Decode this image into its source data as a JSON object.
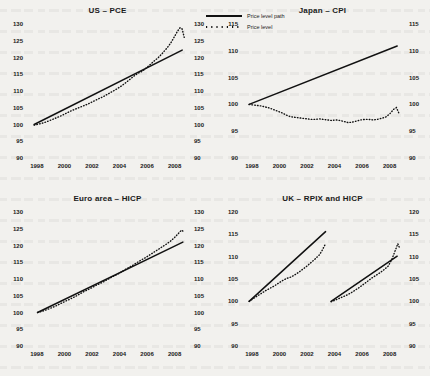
{
  "legend": {
    "items": [
      {
        "name": "price-level-path",
        "label": "Price level path",
        "style": "solid"
      },
      {
        "name": "price-level",
        "label": "Price level",
        "style": "dotted"
      }
    ]
  },
  "colors": {
    "ink": "#111111",
    "paper": "#f2f1ee"
  },
  "chart_data": [
    {
      "type": "line",
      "title": "US – PCE",
      "xlabel": "",
      "ylabel": "",
      "xlim": [
        1997.5,
        2008.9
      ],
      "ylim": [
        90,
        130
      ],
      "yticks": [
        90,
        95,
        100,
        105,
        110,
        115,
        120,
        125,
        130
      ],
      "xticks": [
        1998,
        2000,
        2002,
        2004,
        2006,
        2008
      ],
      "grid": false,
      "dual_axis": true,
      "series": [
        {
          "name": "Price level path",
          "style": "solid",
          "x": [
            1997.8,
            2008.55
          ],
          "values": [
            100.0,
            122.2
          ]
        },
        {
          "name": "Price level",
          "style": "dotted",
          "x": [
            1997.8,
            1998.1,
            1998.4,
            1998.7,
            1999.0,
            1999.3,
            1999.6,
            1999.9,
            2000.2,
            2000.5,
            2000.8,
            2001.1,
            2001.4,
            2001.7,
            2002.0,
            2002.3,
            2002.6,
            2002.9,
            2003.2,
            2003.5,
            2003.8,
            2004.1,
            2004.4,
            2004.7,
            2005.0,
            2005.3,
            2005.6,
            2005.9,
            2006.2,
            2006.5,
            2006.8,
            2007.1,
            2007.4,
            2007.7,
            2008.0,
            2008.2,
            2008.4,
            2008.55,
            2008.7
          ],
          "values": [
            99.8,
            100.1,
            100.4,
            100.8,
            101.3,
            101.8,
            102.3,
            102.9,
            103.5,
            104.1,
            104.6,
            105.1,
            105.6,
            106.1,
            106.7,
            107.3,
            107.9,
            108.5,
            109.2,
            109.9,
            110.6,
            111.4,
            112.3,
            113.3,
            114.3,
            115.2,
            115.8,
            116.7,
            117.8,
            118.9,
            119.9,
            121.2,
            122.6,
            124.2,
            126.3,
            127.8,
            128.9,
            128.5,
            126.0
          ]
        }
      ]
    },
    {
      "type": "line",
      "title": "Japan – CPI",
      "xlabel": "",
      "ylabel": "",
      "xlim": [
        1997.5,
        2008.9
      ],
      "ylim": [
        90,
        115
      ],
      "yticks": [
        90,
        95,
        100,
        105,
        110,
        115
      ],
      "xticks": [
        1998,
        2000,
        2002,
        2004,
        2006,
        2008
      ],
      "grid": false,
      "dual_axis": true,
      "series": [
        {
          "name": "Price level path",
          "style": "solid",
          "x": [
            1997.8,
            2008.55
          ],
          "values": [
            100.0,
            110.9
          ]
        },
        {
          "name": "Price level",
          "style": "dotted",
          "x": [
            1997.8,
            1998.1,
            1998.4,
            1998.7,
            1999.0,
            1999.3,
            1999.6,
            1999.9,
            2000.2,
            2000.5,
            2000.8,
            2001.1,
            2001.4,
            2001.7,
            2002.0,
            2002.3,
            2002.6,
            2002.9,
            2003.2,
            2003.5,
            2003.8,
            2004.1,
            2004.4,
            2004.7,
            2005.0,
            2005.3,
            2005.6,
            2005.9,
            2006.2,
            2006.5,
            2006.8,
            2007.1,
            2007.4,
            2007.7,
            2008.0,
            2008.3,
            2008.5,
            2008.7
          ],
          "values": [
            100.0,
            99.9,
            99.8,
            99.7,
            99.5,
            99.3,
            99.0,
            98.7,
            98.4,
            98.0,
            97.7,
            97.6,
            97.5,
            97.4,
            97.3,
            97.2,
            97.2,
            97.3,
            97.2,
            97.1,
            97.0,
            97.1,
            97.0,
            96.8,
            96.6,
            96.7,
            96.9,
            97.1,
            97.2,
            97.2,
            97.1,
            97.2,
            97.4,
            97.6,
            98.2,
            99.1,
            99.4,
            98.2
          ]
        }
      ]
    },
    {
      "type": "line",
      "title": "Euro area – HICP",
      "xlabel": "",
      "ylabel": "",
      "xlim": [
        1997.5,
        2008.9
      ],
      "ylim": [
        90,
        130
      ],
      "yticks": [
        90,
        95,
        100,
        105,
        110,
        115,
        120,
        125,
        130
      ],
      "xticks": [
        1998,
        2000,
        2002,
        2004,
        2006,
        2008
      ],
      "grid": false,
      "dual_axis": true,
      "series": [
        {
          "name": "Price level path",
          "style": "solid",
          "x": [
            1998.05,
            2008.6
          ],
          "values": [
            100.0,
            121.0
          ]
        },
        {
          "name": "Price level",
          "style": "dotted",
          "x": [
            1998.05,
            1998.4,
            1998.7,
            1999.0,
            1999.3,
            1999.6,
            1999.9,
            2000.2,
            2000.5,
            2000.8,
            2001.1,
            2001.4,
            2001.7,
            2002.0,
            2002.3,
            2002.6,
            2002.9,
            2003.2,
            2003.5,
            2003.8,
            2004.1,
            2004.4,
            2004.7,
            2005.0,
            2005.3,
            2005.6,
            2005.9,
            2006.2,
            2006.5,
            2006.8,
            2007.1,
            2007.4,
            2007.7,
            2008.0,
            2008.3,
            2008.5,
            2008.7
          ],
          "values": [
            100.0,
            100.4,
            100.8,
            101.3,
            101.8,
            102.4,
            103.0,
            103.6,
            104.2,
            104.8,
            105.5,
            106.2,
            106.8,
            107.4,
            108.1,
            108.7,
            109.3,
            110.0,
            110.7,
            111.3,
            112.0,
            112.8,
            113.5,
            114.2,
            115.0,
            115.7,
            116.4,
            117.2,
            118.0,
            118.8,
            119.6,
            120.4,
            121.3,
            122.4,
            123.7,
            124.6,
            124.0
          ]
        }
      ]
    },
    {
      "type": "line",
      "title": "UK – RPIX and HICP",
      "xlabel": "",
      "ylabel": "",
      "xlim": [
        1997.5,
        2008.9
      ],
      "ylim": [
        90,
        120
      ],
      "yticks": [
        90,
        95,
        100,
        105,
        110,
        115,
        120
      ],
      "xticks": [
        1998,
        2000,
        2002,
        2004,
        2006,
        2008
      ],
      "grid": false,
      "dual_axis": true,
      "series": [
        {
          "name": "Price level path",
          "style": "solid",
          "segment": "RPIX",
          "x": [
            1997.8,
            2003.35
          ],
          "values": [
            100.0,
            115.6
          ]
        },
        {
          "name": "Price level",
          "style": "dotted",
          "segment": "RPIX",
          "x": [
            1997.8,
            1998.1,
            1998.4,
            1998.7,
            1999.0,
            1999.3,
            1999.6,
            1999.9,
            2000.2,
            2000.5,
            2000.8,
            2001.1,
            2001.4,
            2001.7,
            2002.0,
            2002.3,
            2002.6,
            2002.9,
            2003.1,
            2003.35
          ],
          "values": [
            100.0,
            100.6,
            101.2,
            101.8,
            102.4,
            102.9,
            103.4,
            104.0,
            104.6,
            105.1,
            105.4,
            105.9,
            106.5,
            107.2,
            107.9,
            108.7,
            109.5,
            110.4,
            111.4,
            112.9
          ]
        },
        {
          "name": "Price level path",
          "style": "solid",
          "segment": "HICP",
          "x": [
            2003.75,
            2008.55
          ],
          "values": [
            100.0,
            110.1
          ]
        },
        {
          "name": "Price level",
          "style": "dotted",
          "segment": "HICP",
          "x": [
            2003.75,
            2004.0,
            2004.3,
            2004.6,
            2004.9,
            2005.2,
            2005.5,
            2005.8,
            2006.1,
            2006.4,
            2006.7,
            2007.0,
            2007.3,
            2007.6,
            2007.9,
            2008.15,
            2008.4,
            2008.6,
            2008.75
          ],
          "values": [
            99.9,
            100.2,
            100.6,
            101.0,
            101.4,
            101.9,
            102.5,
            103.1,
            103.8,
            104.5,
            105.2,
            105.8,
            106.4,
            107.1,
            107.9,
            109.3,
            111.3,
            112.9,
            111.7
          ]
        }
      ]
    }
  ]
}
